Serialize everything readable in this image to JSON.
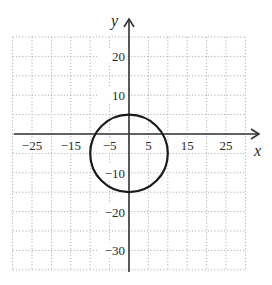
{
  "chart_data": {
    "type": "line",
    "title": "",
    "xlabel": "x",
    "ylabel": "y",
    "xlim": [
      -30,
      35
    ],
    "ylim": [
      -35,
      25
    ],
    "grid": true,
    "grid_spacing": 5,
    "x_ticks": [
      -25,
      -15,
      -5,
      5,
      15,
      25
    ],
    "x_tick_labels": [
      "−25",
      "−15",
      "−5",
      "5",
      "15",
      "25"
    ],
    "y_ticks": [
      20,
      10,
      -10,
      -20,
      -30
    ],
    "y_tick_labels": [
      "20",
      "10",
      "−10",
      "−20",
      "−30"
    ],
    "series": [
      {
        "name": "circle",
        "shape": "circle",
        "center": [
          0,
          -5
        ],
        "radius": 10,
        "equation": "x^2 + (y+5)^2 = 100"
      }
    ]
  },
  "colors": {
    "axis": "#333333",
    "grid": "#b0b0b0",
    "curve": "#1a1a1a"
  }
}
